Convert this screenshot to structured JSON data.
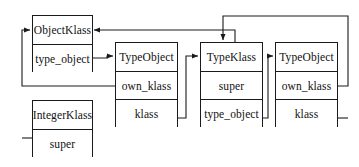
{
  "diagram": {
    "type": "object-reference-diagram",
    "stroke_color": "#1a1a1a",
    "background_color": "#ffffff",
    "text_color": "#111111",
    "nodes": [
      {
        "id": "object_klass",
        "header": "ObjectKlass",
        "fields": [
          "type_object"
        ],
        "x": 32,
        "y": 15,
        "width": 61,
        "height": 57,
        "header_height": 28
      },
      {
        "id": "integer_klass",
        "header": "IntegerKlass",
        "fields": [
          "super"
        ],
        "x": 32,
        "y": 100,
        "width": 61,
        "height": 57,
        "header_height": 28
      },
      {
        "id": "type_object_left",
        "header": "TypeObject",
        "fields": [
          "own_klass",
          "klass"
        ],
        "x": 115,
        "y": 42,
        "width": 63,
        "height": 85,
        "header_height": 28
      },
      {
        "id": "type_klass",
        "header": "TypeKlass",
        "fields": [
          "super",
          "type_object"
        ],
        "x": 200,
        "y": 42,
        "width": 63,
        "height": 85,
        "header_height": 28
      },
      {
        "id": "type_object_right",
        "header": "TypeObject",
        "fields": [
          "own_klass",
          "klass"
        ],
        "x": 275,
        "y": 42,
        "width": 63,
        "height": 85,
        "header_height": 28
      }
    ],
    "edges": [
      {
        "id": "object_klass_type_object_to_type_object_left",
        "from": "object_klass.type_object",
        "to": "type_object_left.header",
        "label": ""
      },
      {
        "id": "type_object_left_own_klass_to_object_klass",
        "from": "type_object_left.own_klass",
        "to": "object_klass.header",
        "label": ""
      },
      {
        "id": "integer_klass_super_to_object_klass",
        "from": "integer_klass.super",
        "to": "object_klass.header",
        "label": ""
      },
      {
        "id": "type_object_left_klass_to_type_klass",
        "from": "type_object_left.klass",
        "to": "type_klass.header",
        "label": ""
      },
      {
        "id": "type_klass_super_to_object_klass",
        "from": "type_klass.super",
        "to": "object_klass.header",
        "label": ""
      },
      {
        "id": "type_klass_type_object_to_type_object_right",
        "from": "type_klass.type_object",
        "to": "type_object_right.header",
        "label": ""
      },
      {
        "id": "type_object_right_own_klass_to_type_klass",
        "from": "type_object_right.own_klass",
        "to": "type_klass.header",
        "label": ""
      },
      {
        "id": "type_object_right_klass_to_type_klass_top",
        "from": "type_object_right.klass",
        "to": "type_klass.header",
        "label": ""
      }
    ]
  }
}
